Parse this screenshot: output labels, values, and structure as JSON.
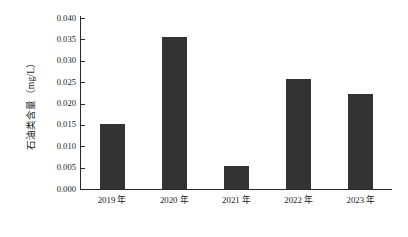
{
  "chart_data": {
    "type": "bar",
    "title": "",
    "xlabel": "",
    "ylabel": "石油类含量（mg/L）",
    "categories": [
      "2019 年",
      "2020 年",
      "2021 年",
      "2022 年",
      "2023 年"
    ],
    "values": [
      0.0152,
      0.0356,
      0.0054,
      0.0257,
      0.0222
    ],
    "ylim": [
      0.0,
      0.04
    ],
    "ytick_step": 0.005,
    "ytick_labels": [
      "0.040",
      "0.035",
      "0.030",
      "0.025",
      "0.020",
      "0.015",
      "0.010",
      "0.005",
      "0.000"
    ],
    "ytick_values": [
      0.04,
      0.035,
      0.03,
      0.025,
      0.02,
      0.015,
      0.01,
      0.005,
      0.0
    ],
    "grid": false,
    "legend": false,
    "bar_color": "#333333",
    "axis_color": "#2b2b2b",
    "background_color": "#ffffff",
    "spines": [
      "left",
      "bottom"
    ],
    "tick_direction": "in"
  }
}
